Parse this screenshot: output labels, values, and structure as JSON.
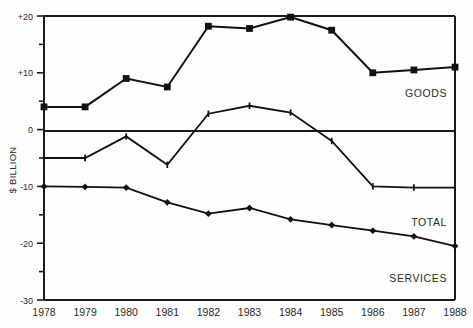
{
  "chart_data": {
    "type": "line",
    "title": "",
    "xlabel": "",
    "ylabel": "$ BILLION",
    "categories": [
      "1978",
      "1979",
      "1980",
      "1981",
      "1982",
      "1983",
      "1984",
      "1985",
      "1986",
      "1987",
      "1988"
    ],
    "x": [
      1978,
      1979,
      1980,
      1981,
      1982,
      1983,
      1984,
      1985,
      1986,
      1987,
      1988
    ],
    "ylim": [
      -30,
      20
    ],
    "yticks": [
      20,
      10,
      0,
      -10,
      -20,
      -30
    ],
    "ytick_labels": [
      "+20",
      "+10",
      "0",
      "-10",
      "-20",
      "-30"
    ],
    "yminor_ticks": [
      15,
      5,
      -5,
      -15,
      -25
    ],
    "grid": false,
    "legend_position": "inline-right",
    "series": [
      {
        "name": "GOODS",
        "marker": "square",
        "values": [
          4,
          4,
          9,
          7.5,
          18.2,
          17.8,
          19.8,
          17.5,
          10,
          10.5,
          11
        ]
      },
      {
        "name": "TOTAL",
        "marker": "tick",
        "values": [
          -5,
          -5,
          -1.2,
          -6.2,
          2.8,
          4.2,
          3,
          -2,
          -10,
          -10.2,
          -10.2
        ]
      },
      {
        "name": "SERVICES",
        "marker": "diamond",
        "values": [
          -10,
          -10.1,
          -10.2,
          -12.8,
          -14.8,
          -13.8,
          -15.8,
          -16.8,
          -17.8,
          -18.8,
          -20.5
        ]
      }
    ]
  },
  "axis": {
    "y_title": "$ BILLION"
  },
  "labels": {
    "goods": "GOODS",
    "total": "TOTAL",
    "services": "SERVICES"
  }
}
